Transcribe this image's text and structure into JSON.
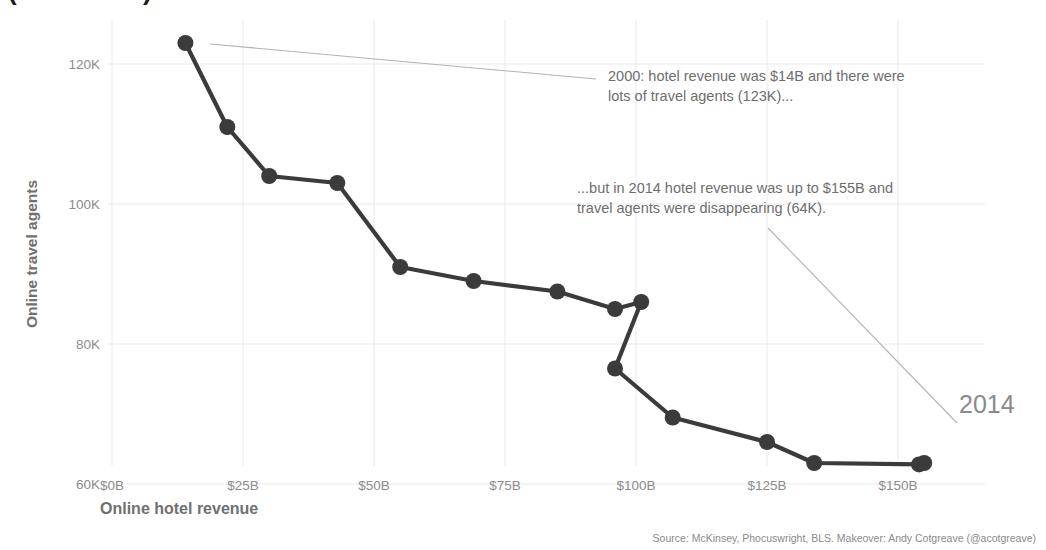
{
  "chart_data": {
    "type": "line",
    "title": "(2000-2014)",
    "xlabel": "Online hotel revenue",
    "ylabel": "Online travel agents",
    "xlim": [
      0,
      163
    ],
    "ylim": [
      58,
      126
    ],
    "grid": true,
    "legend_position": "none",
    "x_unit": "$B",
    "y_unit": "K",
    "xticks": [
      0,
      25,
      50,
      75,
      100,
      125,
      150
    ],
    "xticklabels": [
      "$0B",
      "$25B",
      "$50B",
      "$75B",
      "$100B",
      "$125B",
      "$150B"
    ],
    "yticks": [
      60000,
      80000,
      100000,
      120000
    ],
    "yticklabels": [
      "60K",
      "80K",
      "100K",
      "120K"
    ],
    "series": [
      {
        "name": "Online travel agents vs online hotel revenue",
        "color": "#3b3b3b",
        "marker": "circle",
        "points": [
          {
            "year": 2000,
            "x": 14,
            "y": 123000
          },
          {
            "year": 2001,
            "x": 22,
            "y": 111000
          },
          {
            "year": 2002,
            "x": 30,
            "y": 104000
          },
          {
            "year": 2003,
            "x": 43,
            "y": 103000
          },
          {
            "year": 2004,
            "x": 55,
            "y": 91000
          },
          {
            "year": 2005,
            "x": 69,
            "y": 89000
          },
          {
            "year": 2006,
            "x": 85,
            "y": 87500
          },
          {
            "year": 2007,
            "x": 96,
            "y": 85000
          },
          {
            "year": 2008,
            "x": 101,
            "y": 86000
          },
          {
            "year": 2009,
            "x": 96,
            "y": 76500
          },
          {
            "year": 2010,
            "x": 107,
            "y": 69500
          },
          {
            "year": 2011,
            "x": 125,
            "y": 66000
          },
          {
            "year": 2012,
            "x": 134,
            "y": 63000
          },
          {
            "year": 2013,
            "x": 154,
            "y": 62800
          },
          {
            "year": 2014,
            "x": 155,
            "y": 63000
          }
        ]
      }
    ],
    "annotations": [
      {
        "id": "annotation-0",
        "text": "2000: hotel revenue was  $14B and there were\nlots of travel agents (123K)...",
        "leader": {
          "x1": 210,
          "y1": 44,
          "x2": 596,
          "y2": 79
        }
      },
      {
        "id": "annotation-1",
        "text": "...but in 2014 hotel revenue was up to $155B and\ntravel agents were disappearing (64K).",
        "leader": {
          "x1": 768,
          "y1": 228,
          "x2": 957,
          "y2": 423
        }
      }
    ],
    "point_labels": [
      {
        "id": "point-label-2014",
        "text": "2014",
        "year": 2014
      }
    ]
  },
  "source": {
    "credit": "Source: McKinsey, Phocuswright, BLS. Makeover: Andy Cotgreave (@acotgreave)"
  },
  "colors": {
    "line": "#3b3b3b",
    "marker": "#3b3b3b",
    "grid": "#e9e9e9",
    "annotation_text": "#6e6e6e",
    "leader_line": "#b3b3b3",
    "tick_text": "#8c8c8c",
    "axis_title": "#707070"
  }
}
